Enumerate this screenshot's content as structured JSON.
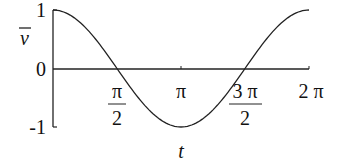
{
  "chart_data": {
    "type": "line",
    "title": "",
    "xlabel": "t",
    "ylabel": "v̄",
    "xlim": [
      0,
      6.2832
    ],
    "ylim": [
      -1,
      1
    ],
    "grid": false,
    "legend": null,
    "x_ticks": [
      {
        "value": 1.5708,
        "label_num": "π",
        "label_den": "2"
      },
      {
        "value": 3.1416,
        "label": "π"
      },
      {
        "value": 4.7124,
        "label_num": "3 π",
        "label_den": "2"
      },
      {
        "value": 6.2832,
        "label": "2 π"
      }
    ],
    "y_ticks": [
      {
        "value": 1,
        "label": "1"
      },
      {
        "value": 0,
        "label": "0"
      },
      {
        "value": -1,
        "label": "-1"
      }
    ],
    "series": [
      {
        "name": "cos(t)",
        "x": [
          0,
          0.7854,
          1.5708,
          2.3562,
          3.1416,
          3.927,
          4.7124,
          5.4978,
          6.2832
        ],
        "values": [
          1,
          0.707,
          0,
          -0.707,
          -1,
          -0.707,
          0,
          0.707,
          1
        ]
      }
    ]
  },
  "labels": {
    "y_axis": "v",
    "x_axis": "t",
    "y1": "1",
    "y0": "0",
    "ym1": "-1",
    "x_pi2_num": "π",
    "x_pi2_den": "2",
    "x_pi": "π",
    "x_3pi2_num": "3 π",
    "x_3pi2_den": "2",
    "x_2pi": "2 π"
  }
}
